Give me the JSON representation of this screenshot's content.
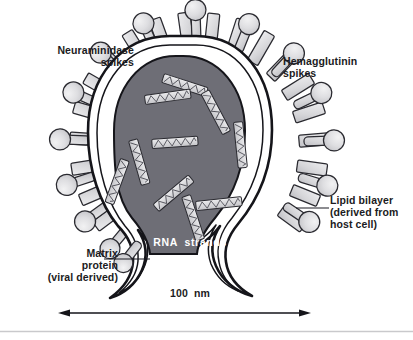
{
  "figure": {
    "background_color": "#ffffff"
  },
  "labels": {
    "neuraminidase": "Neuraminidase\nspikes",
    "hemagglutinin": "Hemagglutinin\nspikes",
    "lipid_bilayer": "Lipid bilayer\n(derived from\nhost cell)",
    "matrix_protein": "Matrix\nprotein\n(viral derived)",
    "rna_strands": "RNA  strands",
    "scale": "100  nm"
  },
  "colors": {
    "ink": "#1b1b22",
    "core_fill": "#6e6e76",
    "envelope_white": "#ffffff",
    "spike_fill": "#d8d8db",
    "spike_fill_light": "#e8e8ea",
    "rna_fill": "#d9d9dc",
    "baseline_rule": "#c9c9cc",
    "label_text": "#1b1b22",
    "rna_text": "#ffffff"
  },
  "structures": {
    "core": {
      "name": "nucleocapsid-core",
      "fill": "#6e6e76",
      "description": "dark gray pear-shaped viral core containing RNA strands"
    },
    "envelope": {
      "name": "lipid-bilayer-envelope",
      "fill": "#ffffff",
      "description": "white double-outlined membrane surrounding the core, budding into a tail at the bottom"
    },
    "spike_types": [
      {
        "name": "neuraminidase-spike",
        "shape": "knob",
        "count": 14
      },
      {
        "name": "hemagglutinin-spike",
        "shape": "rod",
        "count": 20
      }
    ],
    "rna_segment_count": 9
  },
  "scale_bar": {
    "value": "100  nm",
    "x_start": 58,
    "x_end": 311,
    "y": 313,
    "arrowheads": "both"
  },
  "leader_lines": [
    {
      "name": "lipid-bilayer-leader",
      "from_x": 296,
      "from_y": 208,
      "to_x": 329,
      "to_y": 208
    },
    {
      "name": "matrix-protein-leader",
      "from_x": 104,
      "from_y": 259,
      "to_x": 148,
      "to_y": 259
    }
  ]
}
